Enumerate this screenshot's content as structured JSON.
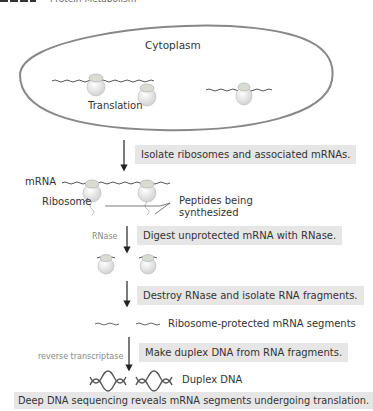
{
  "header": {
    "title": "Protein Metabolism"
  },
  "cell": {
    "label": "Cytoplasm",
    "process_label": "Translation"
  },
  "labels": {
    "mrna": "mRNA",
    "ribosome": "Ribosome",
    "peptides_line1": "Peptides being",
    "peptides_line2": "synthesized",
    "rnase": "RNase",
    "protected_segments": "Ribosome-protected mRNA segments",
    "reverse_transcriptase": "reverse transcriptase",
    "duplex_dna": "Duplex DNA"
  },
  "steps": [
    {
      "text": "Isolate ribosomes and associated mRNAs."
    },
    {
      "text": "Digest unprotected mRNA with RNase."
    },
    {
      "text": "Destroy RNase and isolate RNA fragments."
    },
    {
      "text": "Make duplex DNA from RNA fragments."
    },
    {
      "text": "Deep DNA sequencing reveals mRNA segments undergoing translation."
    }
  ],
  "colors": {
    "step_box": "#e6e6e6",
    "oval_stroke": "#777777",
    "arrow": "#222222"
  }
}
